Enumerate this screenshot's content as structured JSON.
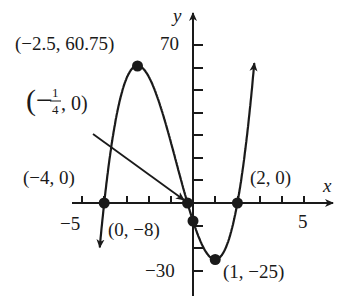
{
  "chart_data": {
    "type": "line",
    "title": "",
    "function_hint": "cubic with x-intercepts -4, -1/4, 2",
    "xlabel": "x",
    "ylabel": "y",
    "xlim": [
      -5.5,
      6
    ],
    "ylim": [
      -40,
      85
    ],
    "grid": false,
    "x_ticks": [
      -5,
      -4,
      -3,
      -2,
      -1,
      1,
      2,
      3,
      4,
      5
    ],
    "x_tick_labels": [
      {
        "value": -5,
        "label": "−5"
      },
      {
        "value": 5,
        "label": "5"
      }
    ],
    "y_ticks": [
      -30,
      -20,
      -10,
      10,
      20,
      30,
      40,
      50,
      60,
      70
    ],
    "y_tick_labels": [
      {
        "value": 70,
        "label": "70"
      },
      {
        "value": -30,
        "label": "−30"
      }
    ],
    "key_points": [
      {
        "x": -2.5,
        "y": 60.75,
        "label": "(−2.5, 60.75)",
        "type": "local max"
      },
      {
        "x": -4,
        "y": 0,
        "label": "(−4, 0)",
        "type": "x-intercept"
      },
      {
        "x": -0.25,
        "y": 0,
        "label": "(−1/4, 0)",
        "type": "x-intercept"
      },
      {
        "x": 0,
        "y": -8,
        "label": "(0, −8)",
        "type": "y-intercept"
      },
      {
        "x": 2,
        "y": 0,
        "label": "(2, 0)",
        "type": "x-intercept"
      },
      {
        "x": 1,
        "y": -25,
        "label": "(1, −25)",
        "type": "local min"
      }
    ],
    "curve_extent": {
      "x_min": -4.2,
      "x_max": 2.8
    },
    "arrows": {
      "left_end": "down",
      "right_end": "up"
    },
    "annotations": [
      {
        "text": "(−1/4, 0)",
        "points_to": {
          "x": -0.25,
          "y": 0
        },
        "style": "arrow"
      }
    ]
  },
  "labels": {
    "max": "(−2.5, 60.75)",
    "neg_quarter_open": "(−",
    "neg_quarter_num": "1",
    "neg_quarter_den": "4",
    "neg_quarter_close": ", 0)",
    "neg4": "(−4, 0)",
    "yint": "(0, −8)",
    "pos2": "(2, 0)",
    "min": "(1, −25)",
    "y70": "70",
    "yneg30": "−30",
    "xneg5": "−5",
    "x5": "5",
    "xname": "x",
    "yname": "y"
  }
}
